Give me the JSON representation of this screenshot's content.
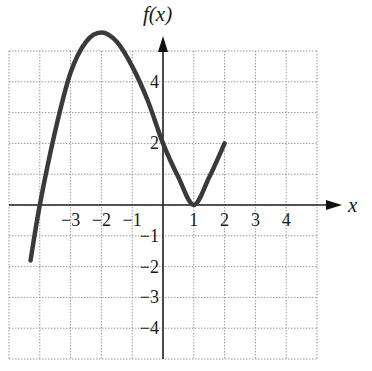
{
  "chart_data": {
    "type": "line",
    "title": "",
    "xlabel": "x",
    "ylabel": "f(x)",
    "xlim": [
      -5,
      5
    ],
    "ylim": [
      -5,
      5
    ],
    "grid": true,
    "x_ticks": [
      "-3",
      "-2",
      "-1",
      "1",
      "2",
      "3",
      "4"
    ],
    "x_tick_values": [
      -3,
      -2,
      -1,
      1,
      2,
      3,
      4
    ],
    "y_ticks": [
      "4",
      "2",
      "-1",
      "-2",
      "-3",
      "-4"
    ],
    "y_tick_values": [
      4,
      2,
      -1,
      -2,
      -3,
      -4
    ],
    "series": [
      {
        "name": "f(x)",
        "x": [
          -4.3,
          -4,
          -3.5,
          -3,
          -2.5,
          -2,
          -1.5,
          -1,
          -0.5,
          0,
          0.5,
          1,
          1.5,
          2
        ],
        "y": [
          -1.8,
          0,
          2.4,
          4.3,
          5.3,
          5.6,
          5.3,
          4.5,
          3.4,
          2,
          0.9,
          0,
          0.9,
          2
        ]
      }
    ],
    "key_points": [
      {
        "x": -2,
        "y": 5.6,
        "note": "local maximum"
      },
      {
        "x": 0,
        "y": 2,
        "note": "y-intercept"
      },
      {
        "x": 1,
        "y": 0,
        "note": "local minimum"
      },
      {
        "x": 2,
        "y": 2,
        "note": "right endpoint"
      }
    ]
  },
  "axes": {
    "x_label": "x",
    "y_label": "f(x)"
  }
}
